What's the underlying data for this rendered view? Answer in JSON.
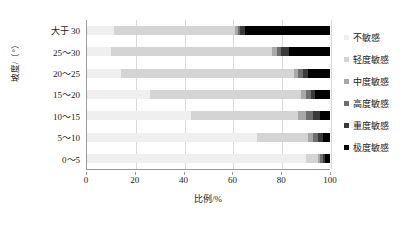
{
  "chart_data": {
    "type": "bar",
    "orientation": "horizontal",
    "stacked": true,
    "stack_mode": "percent",
    "title": "",
    "xlabel": "比例/%",
    "ylabel": "坡度/（°）",
    "xlim": [
      0,
      100
    ],
    "xticks": [
      0,
      20,
      40,
      60,
      80,
      100
    ],
    "xtick_labels": [
      "0",
      "20",
      "40",
      "60",
      "80",
      "100"
    ],
    "grid": "vertical",
    "legend_position": "right",
    "categories": [
      "大于 30",
      "25～30",
      "20～25",
      "15～20",
      "10～15",
      "5～10",
      "0～5"
    ],
    "series": [
      {
        "name": "不敏感",
        "color": "#efefef",
        "values": [
          11,
          10,
          14,
          26,
          43,
          70,
          90
        ]
      },
      {
        "name": "轻度敏感",
        "color": "#d4d4d4",
        "values": [
          50,
          66,
          71,
          62,
          44,
          21,
          5
        ]
      },
      {
        "name": "中度敏感",
        "color": "#a8a8a8",
        "values": [
          1,
          2,
          2,
          2,
          3,
          2,
          1
        ]
      },
      {
        "name": "高度敏感",
        "color": "#6e6e6e",
        "values": [
          1,
          2,
          2,
          2,
          3,
          2,
          1
        ]
      },
      {
        "name": "重度敏感",
        "color": "#3a3a3a",
        "values": [
          2,
          3,
          2,
          2,
          3,
          2,
          1
        ]
      },
      {
        "name": "极度敏感",
        "color": "#000000",
        "values": [
          35,
          17,
          9,
          6,
          4,
          3,
          2
        ]
      }
    ]
  },
  "axis": {
    "y_title": "坡度/（°）",
    "x_title": "比例/%"
  }
}
